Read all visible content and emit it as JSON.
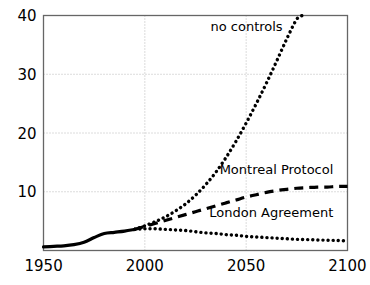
{
  "chart_data": {
    "type": "line",
    "title": "",
    "subtitle": "",
    "xlabel": "",
    "ylabel": "",
    "xlim": [
      1950,
      2100
    ],
    "ylim": [
      0,
      40
    ],
    "grid": true,
    "legend_position": "inline-annotations",
    "x_ticks": [
      "1950",
      "2000",
      "2050",
      "2100"
    ],
    "x_tick_values": [
      1950,
      2000,
      2050,
      2100
    ],
    "y_ticks": [
      "10",
      "20",
      "30",
      "40"
    ],
    "y_tick_values": [
      10,
      20,
      30,
      40
    ],
    "series": [
      {
        "name": "historical",
        "label": "",
        "style": "solid",
        "x": [
          1950,
          1955,
          1960,
          1965,
          1970,
          1975,
          1980,
          1985,
          1990,
          1995
        ],
        "values": [
          0.6,
          0.7,
          0.8,
          1.0,
          1.4,
          2.2,
          2.9,
          3.1,
          3.3,
          3.6
        ]
      },
      {
        "name": "no controls",
        "label": "no controls",
        "style": "dotted",
        "x": [
          1995,
          2000,
          2005,
          2010,
          2015,
          2020,
          2025,
          2030,
          2035,
          2040,
          2045,
          2050,
          2055,
          2060,
          2065,
          2070,
          2075,
          2078
        ],
        "values": [
          3.6,
          4.2,
          4.9,
          5.7,
          6.7,
          7.9,
          9.4,
          11.2,
          13.3,
          15.8,
          18.6,
          21.7,
          25.0,
          28.5,
          32.2,
          36.0,
          39.4,
          40.0
        ]
      },
      {
        "name": "Montreal Protocol",
        "label": "Montreal Protocol",
        "style": "dashed",
        "x": [
          1995,
          2000,
          2005,
          2010,
          2015,
          2020,
          2025,
          2030,
          2035,
          2040,
          2045,
          2050,
          2055,
          2060,
          2065,
          2070,
          2075,
          2080,
          2085,
          2090,
          2095,
          2100
        ],
        "values": [
          3.6,
          4.1,
          4.6,
          5.1,
          5.6,
          6.1,
          6.6,
          7.1,
          7.6,
          8.1,
          8.6,
          9.1,
          9.5,
          9.9,
          10.2,
          10.4,
          10.6,
          10.7,
          10.8,
          10.8,
          10.9,
          10.9
        ]
      },
      {
        "name": "London Agreement",
        "label": "London Agreement",
        "style": "dotted",
        "x": [
          1995,
          2000,
          2005,
          2010,
          2015,
          2020,
          2025,
          2030,
          2035,
          2040,
          2045,
          2050,
          2055,
          2060,
          2065,
          2070,
          2075,
          2080,
          2085,
          2090,
          2095,
          2100
        ],
        "values": [
          3.6,
          3.7,
          3.7,
          3.6,
          3.5,
          3.4,
          3.2,
          3.0,
          2.9,
          2.7,
          2.6,
          2.4,
          2.3,
          2.2,
          2.1,
          2.0,
          1.9,
          1.85,
          1.8,
          1.75,
          1.7,
          1.65
        ]
      }
    ],
    "annotations": [
      {
        "text": "no controls",
        "x": 2068,
        "y": 37.3
      },
      {
        "text": "Montreal Protocol",
        "x": 2093,
        "y": 13.1
      },
      {
        "text": "London Agreement",
        "x": 2093,
        "y": 5.7
      }
    ],
    "colors": {
      "line": "#000000",
      "grid": "#b8b8b8",
      "axis": "#555555",
      "background": "#ffffff",
      "text": "#000000"
    }
  }
}
